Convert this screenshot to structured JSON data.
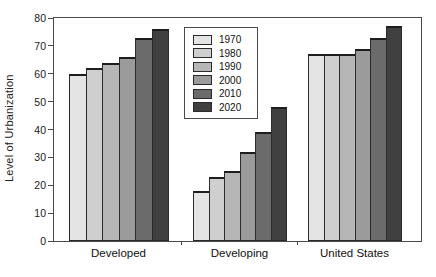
{
  "chart_data": {
    "type": "bar",
    "title": "",
    "xlabel": "",
    "ylabel": "Level of Urbanization",
    "categories": [
      "Developed",
      "Developing",
      "United States"
    ],
    "series": [
      {
        "name": "1970",
        "color": "#e4e4e4",
        "values": [
          60,
          18,
          67
        ]
      },
      {
        "name": "1980",
        "color": "#cfcfcf",
        "values": [
          62,
          23,
          67
        ]
      },
      {
        "name": "1990",
        "color": "#b6b6b6",
        "values": [
          64,
          25,
          67
        ]
      },
      {
        "name": "2000",
        "color": "#9b9b9b",
        "values": [
          66,
          32,
          69
        ]
      },
      {
        "name": "2010",
        "color": "#6b6b6b",
        "values": [
          73,
          39,
          73
        ]
      },
      {
        "name": "2020",
        "color": "#404040",
        "values": [
          76,
          48,
          77
        ]
      }
    ],
    "ylim": [
      0,
      80
    ],
    "yticks": [
      0,
      10,
      20,
      30,
      40,
      50,
      60,
      70,
      80
    ],
    "grid": false,
    "legend_position": "upper-center-left",
    "frame_color": "#4a4a4a"
  }
}
